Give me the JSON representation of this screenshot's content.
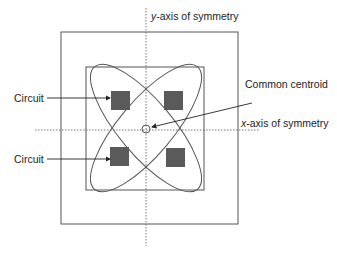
{
  "diagram": {
    "labels": {
      "y_axis": "-axis of symmetry",
      "y_axis_var": "y",
      "x_axis": "-axis of symmetry",
      "x_axis_var": "x",
      "common_centroid": "Common centroid",
      "circuit_top": "Circuit",
      "circuit_bottom": "Circuit"
    },
    "colors": {
      "line": "#555555",
      "square_fill": "#5a5a5a",
      "text": "#222222"
    }
  }
}
